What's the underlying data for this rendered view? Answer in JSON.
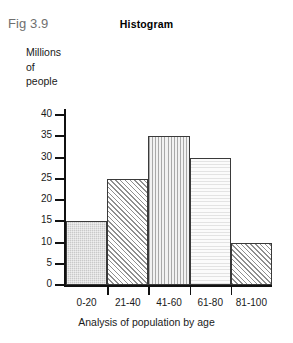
{
  "figure": {
    "label": "Fig 3.9",
    "title": "Histogram"
  },
  "chart_data": {
    "type": "bar",
    "title": "Histogram",
    "xlabel": "Analysis of population by age",
    "ylabel": "Millions of people",
    "ylabel_lines": [
      "Millions",
      "of",
      "people"
    ],
    "categories": [
      "0-20",
      "21-40",
      "41-60",
      "61-80",
      "81-100"
    ],
    "values": [
      15,
      25,
      35,
      30,
      10
    ],
    "ylim": [
      0,
      40
    ],
    "yticks": [
      0,
      5,
      10,
      15,
      20,
      25,
      30,
      35,
      40
    ],
    "ytick_labels": [
      "0",
      "5",
      "10",
      "15",
      "20",
      "25",
      "30",
      "35",
      "40"
    ],
    "grid": false,
    "legend": false,
    "bar_fills": [
      "solid-gray",
      "diagonal-hatch",
      "vertical-lines",
      "horizontal-light",
      "diagonal-hatch"
    ],
    "colors": {
      "axis": "#111111",
      "bar_outline": "#3a3a3a",
      "fig_label": "#6f6f6f",
      "text": "#1a1a1a",
      "background": "#ffffff"
    }
  }
}
